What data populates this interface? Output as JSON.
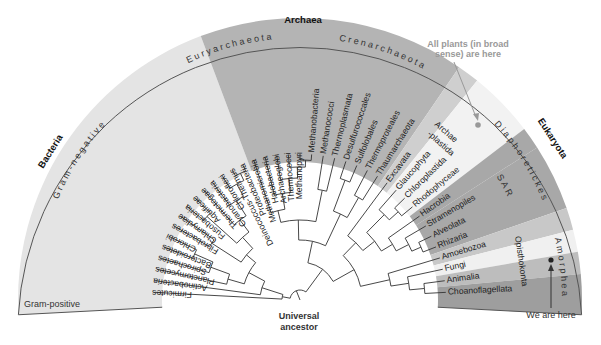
{
  "domains": {
    "bacteria": "Bacteria",
    "archaea": "Archaea",
    "eukaryota": "Eukaryota"
  },
  "groups": {
    "gram_negative": "Gram-negative",
    "gram_positive": "Gram-positive",
    "euryarchaeota": "Euryarchaeota",
    "crenarchaeota": "Crenarchaeota",
    "diaphoretickes": "Diaphoretickes",
    "sar": "SAR",
    "amorphea": "Amorphea",
    "opisthokonta": "Opisthokonta",
    "archaeplastida": [
      "Archae",
      "-plastida"
    ]
  },
  "leaves": [
    "Firmicutes",
    "Actinobacteria",
    "Planctomycetes",
    "Spirochaetes",
    "Bacteroidetes",
    "Chlorobi",
    "Fibrobacteres",
    "Chlamydiae",
    "Fusobacteria",
    "Aquificae",
    "Thermotogae",
    "Cyanobacteria",
    "Chloroflexi",
    "Deinococcus-Thermus",
    "Proteobacteria",
    "Methanomicrobia",
    "Halobacteria",
    "Archaeoglobi",
    "Thermococci",
    "Methanopyri",
    "Methanobacteria",
    "Methanococci",
    "Thermoplasmata",
    "Desulfurococcales",
    "Sulfolobales",
    "Thermoproteales",
    "Thaumarchaeota",
    "Excavata",
    "Glaucophyta",
    "Chloroplastida",
    "Rhodophyceae",
    "Hacrobia",
    "Stramenopiles",
    "Alveolata",
    "Rhizaria",
    "Amoebozoa",
    "Fungi",
    "Animalia",
    "Choanoflagellata"
  ],
  "annotations": {
    "universal_ancestor": [
      "Universal",
      "ancestor"
    ],
    "plants": [
      "All plants (in broad",
      "sense) are here"
    ],
    "we_are_here": "We are here"
  },
  "colors": {
    "bacteria_fill": "#e4e4e4",
    "archaea_fill": "#b4b4b4",
    "excavata_fill": "#cfcfcf",
    "plants_fill": "#f2f2f2",
    "sar_fill": "#a8a8a8",
    "amorphea_fill": "#c8c8c8",
    "fungi_fill": "#f0f0f0",
    "animalia_fill": "#bdbdbd",
    "choano_fill": "#9e9e9e",
    "outline": "#555555",
    "line": "#333333",
    "arrow_grey": "#999999"
  }
}
